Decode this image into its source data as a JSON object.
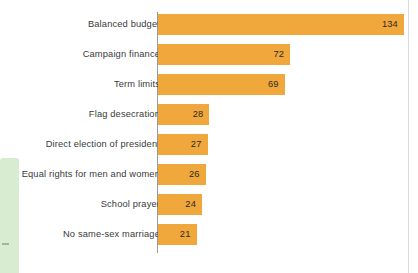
{
  "chart_data": {
    "type": "bar",
    "orientation": "horizontal",
    "title": "",
    "subtitle": "",
    "xlabel": "",
    "ylabel": "",
    "categories": [
      "Balanced budget",
      "Campaign finance",
      "Term limits",
      "Flag desecration",
      "Direct election of president",
      "Equal rights for men and women",
      "School prayer",
      "No same-sex marriage"
    ],
    "values": [
      134,
      72,
      69,
      28,
      27,
      26,
      24,
      21
    ],
    "value_labels": [
      "134",
      "72",
      "69",
      "28",
      "27",
      "26",
      "24",
      "21"
    ],
    "xlim": [
      0,
      134
    ],
    "grid": false,
    "legend": null,
    "bar_color": "#f0a73c",
    "axis_color": "#9a9a9a",
    "label_color": "#3a3a3a",
    "value_label_color": "#2e2a22",
    "background_color": "#ffffff",
    "value_label_position": "inside-end"
  },
  "artifacts": {
    "green_band_color": "#d8ecd2",
    "right_rule_color": "#d9d9d9"
  }
}
